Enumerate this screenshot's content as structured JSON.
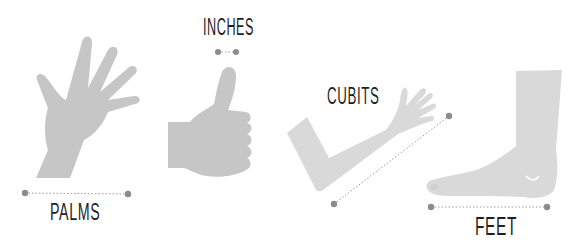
{
  "colors": {
    "shape_dark": "#c6c6c6",
    "shape_light": "#d9d9d9",
    "marker": "#8c8c8c",
    "text": "#1f1f1f",
    "background": "#ffffff"
  },
  "units": [
    {
      "id": "palms",
      "label": "PALMS",
      "icon": "open-hand-icon",
      "measure": {
        "x1": 25,
        "y1": 193,
        "x2": 128,
        "y2": 194
      }
    },
    {
      "id": "inches",
      "label": "INCHES",
      "icon": "thumbs-up-icon",
      "measure": {
        "x1": 218,
        "y1": 52,
        "x2": 236,
        "y2": 52
      }
    },
    {
      "id": "cubits",
      "label": "CUBITS",
      "icon": "forearm-icon",
      "measure": {
        "x1": 334,
        "y1": 204,
        "x2": 449,
        "y2": 116
      }
    },
    {
      "id": "feet",
      "label": "FEET",
      "icon": "foot-icon",
      "measure": {
        "x1": 431,
        "y1": 207,
        "x2": 547,
        "y2": 207
      }
    }
  ]
}
